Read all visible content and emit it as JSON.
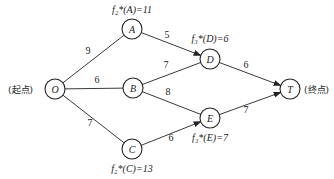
{
  "diagram": {
    "type": "directed-weighted-graph",
    "nodes": [
      {
        "id": "O",
        "label": "O",
        "x": 55,
        "y": 89
      },
      {
        "id": "A",
        "label": "A",
        "x": 132,
        "y": 29
      },
      {
        "id": "B",
        "label": "B",
        "x": 133,
        "y": 88
      },
      {
        "id": "C",
        "label": "C",
        "x": 132,
        "y": 149
      },
      {
        "id": "D",
        "label": "D",
        "x": 210,
        "y": 59
      },
      {
        "id": "E",
        "label": "E",
        "x": 210,
        "y": 118
      },
      {
        "id": "T",
        "label": "T",
        "x": 290,
        "y": 89
      }
    ],
    "edges": [
      {
        "from": "O",
        "to": "A",
        "weight": "9",
        "arrow": false,
        "lx": 88,
        "ly": 54
      },
      {
        "from": "O",
        "to": "B",
        "weight": "6",
        "arrow": false,
        "lx": 97,
        "ly": 83
      },
      {
        "from": "O",
        "to": "C",
        "weight": "7",
        "arrow": false,
        "lx": 90,
        "ly": 126
      },
      {
        "from": "A",
        "to": "D",
        "weight": "5",
        "arrow": true,
        "lx": 167,
        "ly": 38
      },
      {
        "from": "B",
        "to": "D",
        "weight": "7",
        "arrow": false,
        "lx": 166,
        "ly": 68
      },
      {
        "from": "B",
        "to": "E",
        "weight": "8",
        "arrow": false,
        "lx": 168,
        "ly": 95
      },
      {
        "from": "C",
        "to": "E",
        "weight": "6",
        "arrow": true,
        "lx": 171,
        "ly": 141
      },
      {
        "from": "D",
        "to": "T",
        "weight": "6",
        "arrow": true,
        "lx": 246,
        "ly": 68
      },
      {
        "from": "E",
        "to": "T",
        "weight": "7",
        "arrow": true,
        "lx": 246,
        "ly": 113
      }
    ],
    "start_label": "(起点)",
    "end_label": "(终点)",
    "annotations": [
      {
        "node": "A",
        "text": "f₂*(A)=11",
        "x": 132,
        "y": 13
      },
      {
        "node": "D",
        "text": "f₃*(D)=6",
        "x": 210,
        "y": 42
      },
      {
        "node": "E",
        "text": "f₃*(E)=7",
        "x": 210,
        "y": 141
      },
      {
        "node": "C",
        "text": "f₂*(C)=13",
        "x": 132,
        "y": 172
      }
    ],
    "node_radius": 10,
    "stroke_color": "#222222"
  }
}
